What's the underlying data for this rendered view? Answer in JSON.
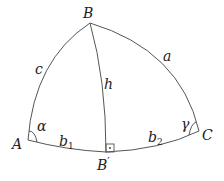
{
  "diagram": {
    "type": "spherical-triangle",
    "vertices": {
      "A": {
        "label": "A"
      },
      "B": {
        "label": "B"
      },
      "C": {
        "label": "C"
      },
      "B_prime": {
        "label": "B",
        "prime": "′"
      }
    },
    "sides": {
      "a": {
        "label": "a"
      },
      "c": {
        "label": "c"
      },
      "h": {
        "label": "h"
      },
      "b1": {
        "label": "b",
        "subscript": "1"
      },
      "b2": {
        "label": "b",
        "subscript": "2"
      }
    },
    "angles": {
      "alpha": {
        "label": "α"
      },
      "gamma": {
        "label": "γ"
      }
    },
    "right_angle_marker": {
      "symbol": "·",
      "at": "B′"
    },
    "colors": {
      "stroke": "#555555",
      "text": "#222222"
    }
  }
}
